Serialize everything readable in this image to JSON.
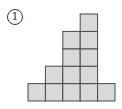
{
  "problem": {
    "label": "1",
    "label_glyph": "①"
  },
  "figure": {
    "type": "stacked-squares",
    "columns": 5,
    "column_heights": [
      1,
      2,
      4,
      5,
      1
    ],
    "cell_size": 17.4,
    "origin_x": 28,
    "baseline_y": 101,
    "fill_color": "#d9d9d9",
    "stroke_color": "#4a4a4a",
    "total_squares": 13
  }
}
